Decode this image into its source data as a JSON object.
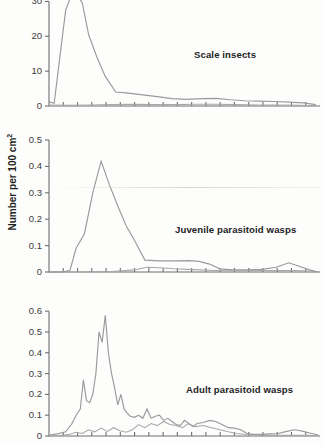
{
  "figure": {
    "axis_title_main": "Number per 100 cm",
    "axis_title_exponent": "2",
    "line_color": "#9a9a9c",
    "axis_color": "#6e6e70",
    "background": "#fdfdfc"
  },
  "chart_data": [
    {
      "type": "line",
      "title": "Scale insects",
      "xlabel": "",
      "ylabel": "Number per 100 cm2",
      "ylim": [
        0,
        35
      ],
      "yticks": [
        0,
        10,
        20,
        30
      ],
      "ytick_labels": [
        "0",
        "10",
        "20",
        "30"
      ],
      "xlim": [
        0,
        26
      ],
      "grid": false,
      "legend": "none",
      "note": "Top series is clipped by the panel top edge above 35",
      "series": [
        {
          "name": "scale-insects-primary",
          "x": [
            0,
            0.5,
            1,
            1.6,
            2.2,
            2.7,
            3.2,
            3.8,
            4.6,
            5.4,
            6.4,
            7.6,
            9,
            10.4,
            11.8,
            13.2,
            14.6,
            16,
            17.4,
            18.8,
            20.2,
            21.6,
            23,
            24.4,
            25.6
          ],
          "values": [
            1.2,
            0.8,
            13,
            27.5,
            33.5,
            37,
            29.5,
            20.5,
            14,
            8.5,
            4,
            3.7,
            3.2,
            2.7,
            2.1,
            1.9,
            2.1,
            2.2,
            1.8,
            1.5,
            1.4,
            1.3,
            1.1,
            0.9,
            0.4
          ]
        },
        {
          "name": "scale-insects-secondary",
          "x": [
            0,
            2,
            4,
            6,
            8,
            10,
            12,
            14,
            16,
            18,
            20,
            22,
            24,
            25.6
          ],
          "values": [
            0.3,
            0.2,
            0.3,
            0.4,
            0.5,
            0.4,
            0.4,
            0.5,
            0.5,
            0.4,
            0.3,
            0.3,
            0.2,
            0.1
          ]
        }
      ]
    },
    {
      "type": "line",
      "title": "Juvenile parasitoid wasps",
      "xlabel": "",
      "ylabel": "Number per 100 cm2",
      "ylim": [
        0,
        0.5
      ],
      "yticks": [
        0,
        0.1,
        0.2,
        0.3,
        0.4,
        0.5
      ],
      "ytick_labels": [
        "0",
        "0.1",
        "0.2",
        "0.3",
        "0.4",
        "0.5"
      ],
      "xlim": [
        0,
        26
      ],
      "grid": false,
      "legend": "none",
      "series": [
        {
          "name": "juvenile-wasps-primary",
          "x": [
            0,
            1.2,
            2.0,
            2.6,
            3.4,
            4.2,
            5.0,
            5.8,
            6.6,
            7.4,
            8.2,
            9.2,
            10.6,
            12.0,
            13.4,
            14.4,
            15.4,
            16.4,
            17.6,
            19.0,
            20.4,
            21.8,
            23.0,
            24.0,
            25.0,
            25.8
          ],
          "values": [
            0.0,
            0.0,
            0.005,
            0.09,
            0.145,
            0.3,
            0.42,
            0.33,
            0.25,
            0.175,
            0.12,
            0.045,
            0.042,
            0.042,
            0.043,
            0.04,
            0.03,
            0.012,
            0.008,
            0.008,
            0.01,
            0.018,
            0.035,
            0.022,
            0.008,
            0.0
          ]
        },
        {
          "name": "juvenile-wasps-secondary",
          "x": [
            0,
            3,
            6,
            8.2,
            9.4,
            10.6,
            12.0,
            13.2,
            14.6,
            16.0,
            17.4,
            19.0,
            20.6,
            22.2,
            23.6,
            25.0,
            25.8
          ],
          "values": [
            0.0,
            0.0,
            0.002,
            0.008,
            0.018,
            0.016,
            0.012,
            0.01,
            0.008,
            0.006,
            0.005,
            0.005,
            0.006,
            0.006,
            0.006,
            0.004,
            0.0
          ]
        }
      ]
    },
    {
      "type": "line",
      "title": "Adult parasitoid wasps",
      "xlabel": "",
      "ylabel": "Number per 100 cm2",
      "ylim": [
        0,
        0.62
      ],
      "yticks": [
        0,
        0.1,
        0.2,
        0.3,
        0.4,
        0.5,
        0.6
      ],
      "ytick_labels": [
        "0",
        "0.1",
        "0.2",
        "0.3",
        "0.4",
        "0.5",
        "0.6"
      ],
      "xlim": [
        0,
        26
      ],
      "grid": false,
      "legend": "none",
      "series": [
        {
          "name": "adult-wasps-primary",
          "x": [
            0,
            0.8,
            1.6,
            2.2,
            2.6,
            3.0,
            3.3,
            3.6,
            3.9,
            4.2,
            4.5,
            4.8,
            5.1,
            5.4,
            5.7,
            6.0,
            6.3,
            6.6,
            6.9,
            7.2,
            7.5,
            7.8,
            8.2,
            8.6,
            9.0,
            9.4,
            9.8,
            10.2,
            10.6,
            11.0,
            11.4,
            11.8,
            12.2,
            12.6,
            13.0,
            13.4,
            13.8,
            14.2,
            14.8,
            15.4,
            16.0,
            16.6,
            17.2,
            17.8,
            18.4,
            19.0,
            19.6,
            20.4,
            21.2,
            22.0,
            22.8,
            23.6,
            24.4,
            25.2,
            25.8
          ],
          "values": [
            0.005,
            0.01,
            0.02,
            0.06,
            0.1,
            0.13,
            0.27,
            0.17,
            0.16,
            0.2,
            0.3,
            0.5,
            0.45,
            0.58,
            0.4,
            0.3,
            0.23,
            0.15,
            0.2,
            0.13,
            0.11,
            0.095,
            0.09,
            0.1,
            0.085,
            0.13,
            0.085,
            0.095,
            0.1,
            0.075,
            0.085,
            0.07,
            0.055,
            0.05,
            0.075,
            0.06,
            0.045,
            0.06,
            0.065,
            0.075,
            0.07,
            0.055,
            0.04,
            0.038,
            0.03,
            0.012,
            0.008,
            0.008,
            0.01,
            0.012,
            0.022,
            0.03,
            0.022,
            0.012,
            0.006
          ]
        },
        {
          "name": "adult-wasps-secondary",
          "x": [
            0,
            1.0,
            2.0,
            2.6,
            3.2,
            3.8,
            4.4,
            5.0,
            5.6,
            6.2,
            6.8,
            7.4,
            8.0,
            8.6,
            9.2,
            9.8,
            10.4,
            11.0,
            11.6,
            12.2,
            12.8,
            13.4,
            14.0,
            14.8,
            15.6,
            16.4,
            17.2,
            18.0,
            18.8,
            19.6,
            20.6,
            21.6,
            22.6,
            23.6,
            24.6,
            25.8
          ],
          "values": [
            0.0,
            0.002,
            0.008,
            0.018,
            0.012,
            0.03,
            0.02,
            0.038,
            0.022,
            0.04,
            0.025,
            0.018,
            0.03,
            0.055,
            0.04,
            0.06,
            0.05,
            0.07,
            0.055,
            0.05,
            0.04,
            0.06,
            0.045,
            0.05,
            0.04,
            0.03,
            0.02,
            0.012,
            0.008,
            0.006,
            0.005,
            0.004,
            0.004,
            0.004,
            0.003,
            0.002
          ]
        }
      ]
    }
  ]
}
